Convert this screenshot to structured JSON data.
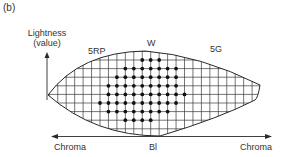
{
  "panel_label": "(b)",
  "axis": {
    "vertical_label_line1": "Lightness",
    "vertical_label_line2": "(value)",
    "left_label": "Chroma",
    "right_label": "Chroma"
  },
  "hue_labels": {
    "top": "W",
    "bottom": "Bl",
    "left": "5RP",
    "right": "5G"
  },
  "colors": {
    "line": "#2a2a2a",
    "grid": "#3a3a3a",
    "dot": "#111111",
    "background": "#ffffff"
  },
  "grid": {
    "origin_x": 100,
    "origin_y": 60,
    "col_spacing": 8.45,
    "row_spacing": 8.6,
    "dot_rows": [
      {
        "row": 0,
        "cols": [
          5,
          6,
          7
        ]
      },
      {
        "row": 1,
        "cols": [
          3,
          4,
          5,
          6,
          7,
          8,
          9
        ]
      },
      {
        "row": 2,
        "cols": [
          2,
          3,
          4,
          5,
          6,
          7,
          8,
          9
        ]
      },
      {
        "row": 3,
        "cols": [
          1,
          2,
          3,
          4,
          5,
          6,
          7,
          8,
          9
        ]
      },
      {
        "row": 4,
        "cols": [
          1,
          2,
          3,
          4,
          5,
          6,
          7,
          8,
          9,
          10
        ]
      },
      {
        "row": 5,
        "cols": [
          0,
          1,
          2,
          3,
          4,
          5,
          6,
          7,
          8,
          9
        ]
      },
      {
        "row": 6,
        "cols": [
          1,
          2,
          3,
          4,
          5,
          6,
          7,
          8
        ]
      },
      {
        "row": 7,
        "cols": [
          3,
          4,
          5,
          6
        ]
      }
    ]
  }
}
